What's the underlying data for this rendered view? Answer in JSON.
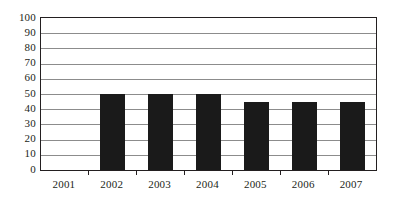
{
  "chart_data": {
    "type": "bar",
    "title": "",
    "subtitle": "",
    "xlabel": "",
    "ylabel": "",
    "categories": [
      "2001",
      "2002",
      "2003",
      "2004",
      "2005",
      "2006",
      "2007"
    ],
    "values": [
      0,
      50,
      50,
      50,
      45,
      45,
      45
    ],
    "series": [
      {
        "name": "",
        "values": [
          0,
          50,
          50,
          50,
          45,
          45,
          45
        ]
      }
    ],
    "ylim": [
      0,
      100
    ],
    "ytick_step": 10,
    "yticks": [
      0,
      10,
      20,
      30,
      40,
      50,
      60,
      70,
      80,
      90,
      100
    ],
    "ytick_labels": [
      "0",
      "10",
      "20",
      "30",
      "40",
      "50",
      "60",
      "70",
      "80",
      "90",
      "100"
    ],
    "grid": true,
    "grid_axis": "y",
    "legend": false,
    "legend_position": "none",
    "annotations": [],
    "colors": {
      "bar": "#1a1a1a",
      "gridline": "#8c8c8c",
      "axis": "#231f20",
      "background": "#ffffff",
      "text": "#231f20"
    }
  }
}
